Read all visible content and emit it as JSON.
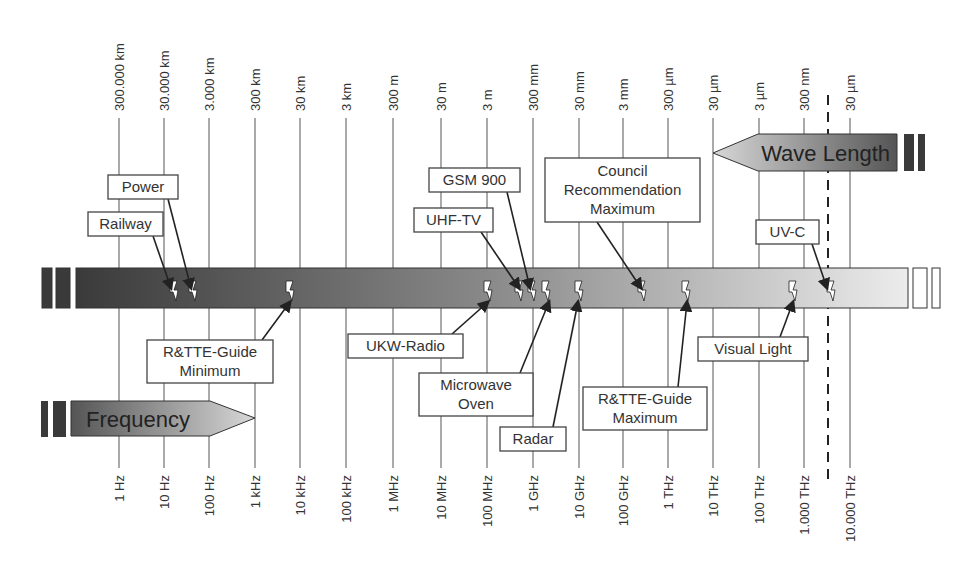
{
  "diagram": {
    "wavelength_axis": {
      "label": "Wave Length",
      "ticks": [
        "300.000 km",
        "30.000 km",
        "3.000 km",
        "300 km",
        "30 km",
        "3 km",
        "300 m",
        "30 m",
        "3 m",
        "300 mm",
        "30 mm",
        "3 mm",
        "300 µm",
        "30 µm",
        "3 µm",
        "300 nm",
        "30 µm"
      ]
    },
    "frequency_axis": {
      "label": "Frequency",
      "ticks": [
        "1 Hz",
        "10 Hz",
        "100 Hz",
        "1 kHz",
        "10 kHz",
        "100 kHz",
        "1 MHz",
        "10 MHz",
        "100 MHz",
        "1 GHz",
        "10 GHz",
        "100 GHz",
        "1 THz",
        "10 THz",
        "100 THz",
        "1.000 THz",
        "10.000 THz"
      ]
    },
    "grid_x": [
      119,
      164,
      209,
      255,
      300,
      346,
      393,
      441,
      487,
      533,
      579,
      623,
      668,
      713,
      759,
      804,
      850
    ],
    "dashed_line_x": 828,
    "band": {
      "x": 75,
      "y": 268,
      "w": 833,
      "h": 40,
      "color_start": "#3a3a3a",
      "color_end": "#e8e8e8"
    },
    "annotations": {
      "above": [
        {
          "id": "power",
          "lines": [
            "Power"
          ],
          "box": [
            108,
            175,
            70,
            24
          ],
          "from": [
            168,
            199
          ],
          "to": [
            191,
            288
          ]
        },
        {
          "id": "railway",
          "lines": [
            "Railway"
          ],
          "box": [
            88,
            212,
            75,
            24
          ],
          "from": [
            153,
            236
          ],
          "to": [
            171,
            288
          ]
        },
        {
          "id": "gsm900",
          "lines": [
            "GSM 900"
          ],
          "box": [
            429,
            168,
            91,
            24
          ],
          "from": [
            507,
            192
          ],
          "to": [
            530,
            288
          ]
        },
        {
          "id": "uhf-tv",
          "lines": [
            "UHF-TV"
          ],
          "box": [
            414,
            208,
            79,
            24
          ],
          "from": [
            481,
            232
          ],
          "to": [
            519,
            288
          ]
        },
        {
          "id": "council",
          "lines": [
            "Council",
            "Recommendation",
            "Maximum"
          ],
          "box": [
            545,
            158,
            155,
            64
          ],
          "from": [
            597,
            222
          ],
          "to": [
            641,
            288
          ]
        },
        {
          "id": "uv-c",
          "lines": [
            "UV-C"
          ],
          "box": [
            756,
            220,
            63,
            24
          ],
          "from": [
            812,
            244
          ],
          "to": [
            827,
            288
          ]
        }
      ],
      "below": [
        {
          "id": "rttte-min",
          "lines": [
            "R&TTE-Guide",
            "Minimum"
          ],
          "box": [
            147,
            340,
            126,
            43
          ],
          "from": [
            262,
            340
          ],
          "to": [
            290,
            302
          ]
        },
        {
          "id": "ukw-radio",
          "lines": [
            "UKW-Radio"
          ],
          "box": [
            348,
            334,
            115,
            24
          ],
          "from": [
            452,
            334
          ],
          "to": [
            488,
            302
          ]
        },
        {
          "id": "microwave",
          "lines": [
            "Microwave",
            "Oven"
          ],
          "box": [
            419,
            373,
            114,
            43
          ],
          "from": [
            520,
            373
          ],
          "to": [
            549,
            302
          ]
        },
        {
          "id": "radar",
          "lines": [
            "Radar"
          ],
          "box": [
            500,
            427,
            66,
            24
          ],
          "from": [
            553,
            427
          ],
          "to": [
            578,
            302
          ]
        },
        {
          "id": "rttte-max",
          "lines": [
            "R&TTE-Guide",
            "Maximum"
          ],
          "box": [
            583,
            387,
            124,
            43
          ],
          "from": [
            678,
            387
          ],
          "to": [
            687,
            302
          ]
        },
        {
          "id": "visual-light",
          "lines": [
            "Visual Light"
          ],
          "box": [
            698,
            337,
            110,
            24
          ],
          "from": [
            780,
            337
          ],
          "to": [
            793,
            302
          ]
        }
      ]
    },
    "bolts_x": [
      174,
      193,
      290,
      488,
      519,
      532,
      546,
      579,
      642,
      686,
      793,
      831
    ]
  }
}
